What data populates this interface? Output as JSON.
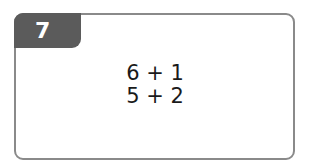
{
  "problem": {
    "number": "7",
    "expressions": [
      "6 + 1",
      "5 + 2"
    ]
  },
  "colors": {
    "tab_background": "#5b5b5b",
    "border": "#8a8a8a",
    "text": "#1a1a1a"
  }
}
